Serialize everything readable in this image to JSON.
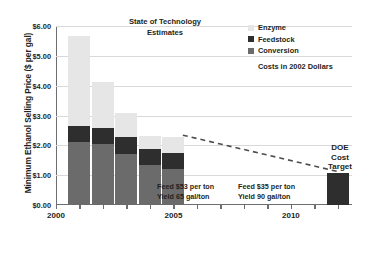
{
  "chart_data": {
    "type": "bar",
    "subtype": "stacked-bar-with-trendline",
    "title": "State of Technology Estimates",
    "xlabel": "",
    "ylabel": "Minimum Ethanol Selling Price ($ per gal)",
    "ylim": [
      0.0,
      6.0
    ],
    "xlim": [
      2000,
      2012.6
    ],
    "ytick_labels": [
      "$0.00",
      "$1.00",
      "$2.00",
      "$3.00",
      "$4.00",
      "$5.00",
      "$6.00"
    ],
    "ytick_values": [
      0,
      1,
      2,
      3,
      4,
      5,
      6
    ],
    "xtick_labels": [
      "2000",
      "2005",
      "2010"
    ],
    "xtick_values": [
      2000,
      2005,
      2010
    ],
    "grid": true,
    "legend_position": "top-right",
    "categories": [
      2001,
      2002,
      2003,
      2004,
      2005
    ],
    "series": [
      {
        "name": "Conversion",
        "color": "#6b6b6b",
        "values": [
          2.11,
          2.03,
          1.72,
          1.33,
          1.22
        ]
      },
      {
        "name": "Feedstock",
        "color": "#2e2e2e",
        "values": [
          0.55,
          0.54,
          0.55,
          0.54,
          0.53
        ]
      },
      {
        "name": "Enzyme",
        "color": "#e6e6e6",
        "values": [
          2.99,
          1.56,
          0.83,
          0.44,
          0.53
        ]
      }
    ],
    "bar_totals": [
      5.65,
      4.13,
      3.1,
      2.31,
      2.28
    ],
    "target_bar": {
      "name": "DOE Cost Target",
      "year": 2012,
      "value": 1.07,
      "color": "#2e2e2e"
    },
    "trendline": {
      "style": "dashed",
      "color": "#4d4d4d",
      "points": [
        [
          2005.4,
          2.34
        ],
        [
          2012.0,
          1.12
        ]
      ]
    },
    "annotations": [
      {
        "id": "note-1",
        "line1": "Feed $53 per ton",
        "line2": "Yield 65 gal/ton"
      },
      {
        "id": "note-2",
        "line1": "Feed $35 per ton",
        "line2": "Yield 90 gal/ton"
      }
    ]
  },
  "axis": {
    "y_title": "Minimum Ethanol Selling Price ($ per gal)",
    "y_ticks": [
      "$6.00",
      "$5.00",
      "$4.00",
      "$3.00",
      "$2.00",
      "$1.00",
      "$0.00"
    ],
    "x_ticks": [
      "2000",
      "2005",
      "2010"
    ]
  },
  "titles": {
    "state_of_technology_line1": "State of Technology",
    "state_of_technology_line2": "Estimates"
  },
  "legend": {
    "items": [
      {
        "label": "Enzyme",
        "color": "#e6e6e6"
      },
      {
        "label": "Feedstock",
        "color": "#2e2e2e"
      },
      {
        "label": "Conversion",
        "color": "#6b6b6b"
      }
    ],
    "note": "Costs in 2002 Dollars"
  },
  "notes": {
    "note_1_line_1": "Feed $53 per ton",
    "note_1_line_2": "Yield 65 gal/ton",
    "note_2_line_1": "Feed $35 per ton",
    "note_2_line_2": "Yield 90 gal/ton"
  },
  "target": {
    "line1": "DOE",
    "line2": "Cost",
    "line3": "Target"
  },
  "colors": {
    "enzyme": "#e6e6e6",
    "feedstock": "#2e2e2e",
    "conversion": "#6b6b6b",
    "grid": "#d9d9d9",
    "axis": "#6d6e71",
    "text": "#231f20",
    "trend": "#4d4d4d"
  }
}
